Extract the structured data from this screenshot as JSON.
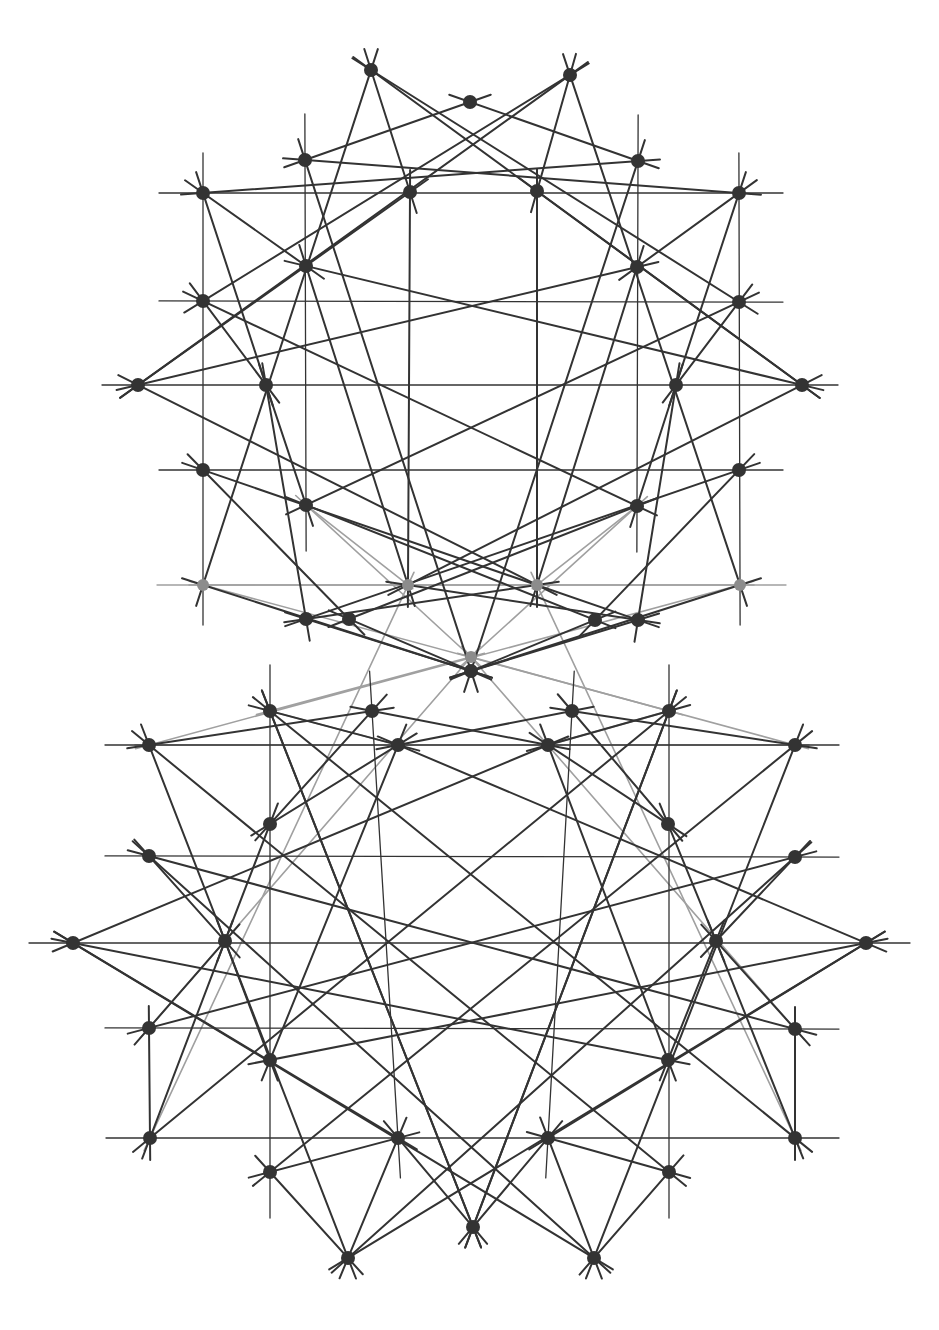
{
  "figure": {
    "canvas": {
      "width": 939,
      "height": 1330,
      "background": "#ffffff"
    },
    "style": {
      "node_color_dark": "#333333",
      "node_color_gray": "#8c8c8c",
      "line_color_dark": "#333333",
      "line_color_gray": "#a0a0a0",
      "line_width_dark": 2.0,
      "line_width_thin": 1.3,
      "line_width_gray": 1.6,
      "node_radius": 7.0,
      "node_radius_small": 6.0
    },
    "blocks": [
      {
        "name": "upper-configuration",
        "center_x": 470.5,
        "center_y": 385,
        "mirrored": false
      },
      {
        "name": "lower-configuration",
        "center_x": 470.5,
        "center_y": 945,
        "mirrored": true
      }
    ],
    "nodes_upper": [
      {
        "id": "u1",
        "x": 371,
        "y": 70,
        "tone": "dark"
      },
      {
        "id": "u2",
        "x": 470,
        "y": 102,
        "tone": "dark"
      },
      {
        "id": "u3",
        "x": 570,
        "y": 75,
        "tone": "dark"
      },
      {
        "id": "u4",
        "x": 305,
        "y": 160,
        "tone": "dark"
      },
      {
        "id": "u5",
        "x": 638,
        "y": 161,
        "tone": "dark"
      },
      {
        "id": "u6",
        "x": 203,
        "y": 193,
        "tone": "dark"
      },
      {
        "id": "u7",
        "x": 410,
        "y": 192,
        "tone": "dark"
      },
      {
        "id": "u8",
        "x": 537,
        "y": 191,
        "tone": "dark"
      },
      {
        "id": "u9",
        "x": 739,
        "y": 193,
        "tone": "dark"
      },
      {
        "id": "u10",
        "x": 306,
        "y": 266,
        "tone": "dark"
      },
      {
        "id": "u11",
        "x": 637,
        "y": 267,
        "tone": "dark"
      },
      {
        "id": "u12",
        "x": 203,
        "y": 301,
        "tone": "dark"
      },
      {
        "id": "u13",
        "x": 739,
        "y": 302,
        "tone": "dark"
      },
      {
        "id": "u14",
        "x": 138,
        "y": 385,
        "tone": "dark"
      },
      {
        "id": "u15",
        "x": 266,
        "y": 385,
        "tone": "dark"
      },
      {
        "id": "u16",
        "x": 676,
        "y": 385,
        "tone": "dark"
      },
      {
        "id": "u17",
        "x": 802,
        "y": 385,
        "tone": "dark"
      },
      {
        "id": "u18",
        "x": 203,
        "y": 470,
        "tone": "dark"
      },
      {
        "id": "u19",
        "x": 739,
        "y": 470,
        "tone": "dark"
      },
      {
        "id": "u20",
        "x": 306,
        "y": 505,
        "tone": "dark"
      },
      {
        "id": "u21",
        "x": 637,
        "y": 506,
        "tone": "dark"
      },
      {
        "id": "u22",
        "x": 203,
        "y": 585,
        "tone": "gray"
      },
      {
        "id": "u23",
        "x": 408,
        "y": 585,
        "tone": "gray"
      },
      {
        "id": "u24",
        "x": 537,
        "y": 585,
        "tone": "gray"
      },
      {
        "id": "u25",
        "x": 740,
        "y": 585,
        "tone": "gray"
      },
      {
        "id": "u26",
        "x": 306,
        "y": 619,
        "tone": "dark"
      },
      {
        "id": "u27",
        "x": 349,
        "y": 619,
        "tone": "dark"
      },
      {
        "id": "u28",
        "x": 595,
        "y": 620,
        "tone": "dark"
      },
      {
        "id": "u29",
        "x": 638,
        "y": 620,
        "tone": "dark"
      },
      {
        "id": "u30",
        "x": 471,
        "y": 657,
        "tone": "gray"
      },
      {
        "id": "u31",
        "x": 471,
        "y": 671,
        "tone": "dark"
      }
    ],
    "nodes_lower": [
      {
        "id": "l1",
        "x": 270,
        "y": 711,
        "tone": "dark"
      },
      {
        "id": "l2",
        "x": 372,
        "y": 711,
        "tone": "dark"
      },
      {
        "id": "l3",
        "x": 572,
        "y": 711,
        "tone": "dark"
      },
      {
        "id": "l4",
        "x": 669,
        "y": 711,
        "tone": "dark"
      },
      {
        "id": "l5",
        "x": 149,
        "y": 745,
        "tone": "dark"
      },
      {
        "id": "l6",
        "x": 398,
        "y": 745,
        "tone": "dark"
      },
      {
        "id": "l7",
        "x": 548,
        "y": 745,
        "tone": "dark"
      },
      {
        "id": "l8",
        "x": 795,
        "y": 745,
        "tone": "dark"
      },
      {
        "id": "l9",
        "x": 270,
        "y": 824,
        "tone": "dark"
      },
      {
        "id": "l10",
        "x": 668,
        "y": 824,
        "tone": "dark"
      },
      {
        "id": "l11",
        "x": 149,
        "y": 856,
        "tone": "dark"
      },
      {
        "id": "l12",
        "x": 795,
        "y": 857,
        "tone": "dark"
      },
      {
        "id": "l13",
        "x": 73,
        "y": 943,
        "tone": "dark"
      },
      {
        "id": "l14",
        "x": 225,
        "y": 941,
        "tone": "dark"
      },
      {
        "id": "l15",
        "x": 716,
        "y": 941,
        "tone": "dark"
      },
      {
        "id": "l16",
        "x": 866,
        "y": 943,
        "tone": "dark"
      },
      {
        "id": "l17",
        "x": 149,
        "y": 1028,
        "tone": "dark"
      },
      {
        "id": "l18",
        "x": 795,
        "y": 1029,
        "tone": "dark"
      },
      {
        "id": "l19",
        "x": 270,
        "y": 1060,
        "tone": "dark"
      },
      {
        "id": "l20",
        "x": 668,
        "y": 1060,
        "tone": "dark"
      },
      {
        "id": "l21",
        "x": 150,
        "y": 1138,
        "tone": "dark"
      },
      {
        "id": "l22",
        "x": 398,
        "y": 1138,
        "tone": "dark"
      },
      {
        "id": "l23",
        "x": 548,
        "y": 1138,
        "tone": "dark"
      },
      {
        "id": "l24",
        "x": 795,
        "y": 1138,
        "tone": "dark"
      },
      {
        "id": "l25",
        "x": 270,
        "y": 1172,
        "tone": "dark"
      },
      {
        "id": "l26",
        "x": 669,
        "y": 1172,
        "tone": "dark"
      },
      {
        "id": "l27",
        "x": 473,
        "y": 1227,
        "tone": "dark"
      },
      {
        "id": "l28",
        "x": 348,
        "y": 1258,
        "tone": "dark"
      },
      {
        "id": "l29",
        "x": 594,
        "y": 1258,
        "tone": "dark"
      }
    ],
    "counts": {
      "nodes_total": 60,
      "nodes_upper": 31,
      "nodes_lower": 29,
      "gray_nodes": 5
    }
  }
}
